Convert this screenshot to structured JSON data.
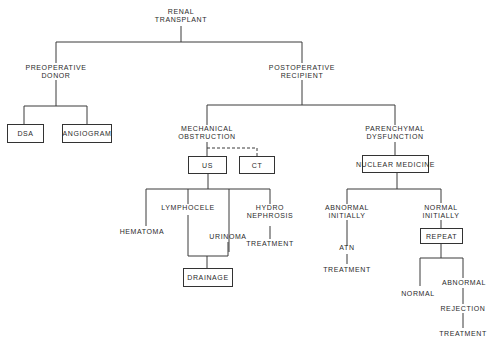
{
  "diagram": {
    "root": {
      "line1": "RENAL",
      "line2": "TRANSPLANT"
    },
    "preop": {
      "line1": "PREOPERATIVE",
      "line2": "DONOR"
    },
    "postop": {
      "line1": "POSTOPERATIVE",
      "line2": "RECIPIENT"
    },
    "dsa": "DSA",
    "angiogram": "ANGIOGRAM",
    "mech": {
      "line1": "MECHANICAL",
      "line2": "OBSTRUCTION"
    },
    "paren": {
      "line1": "PARENCHYMAL",
      "line2": "DYSFUNCTION"
    },
    "us": "US",
    "ct": "CT",
    "nuclear": "NUCLEAR MEDICINE",
    "hematoma": "HEMATOMA",
    "lymphocele": "LYMPHOCELE",
    "urinoma": "URINOMA",
    "hydro": {
      "line1": "HYDRO",
      "line2": "NEPHROSIS"
    },
    "hydro_treatment": "TREATMENT",
    "drainage": "DRAINAGE",
    "abn_init": {
      "line1": "ABNORMAL",
      "line2": "INITIALLY"
    },
    "norm_init": {
      "line1": "NORMAL",
      "line2": "INITIALLY"
    },
    "atn": "ATN",
    "atn_treatment": "TREATMENT",
    "repeat": "REPEAT",
    "normal": "NORMAL",
    "abnormal": "ABNORMAL",
    "rejection": "REJECTION",
    "rej_treatment": "TREATMENT"
  }
}
